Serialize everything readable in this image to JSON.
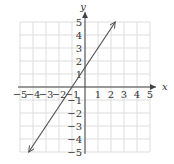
{
  "chart_data": {
    "type": "line",
    "title": "",
    "xlabel": "x",
    "ylabel": "y",
    "xlim": [
      -5,
      5
    ],
    "ylim": [
      -5,
      5
    ],
    "grid": true,
    "x_ticks": [
      "-5",
      "-4",
      "-3",
      "-2",
      "-1",
      "1",
      "2",
      "3",
      "4",
      "5"
    ],
    "y_ticks": [
      "5",
      "4",
      "3",
      "2",
      "1",
      "-1",
      "-2",
      "-3",
      "-4",
      "-5"
    ],
    "series": [
      {
        "name": "line",
        "equation": "y = 1.5x + 1.5",
        "points": [
          [
            -4.33,
            -5
          ],
          [
            -1,
            0
          ],
          [
            0,
            1.5
          ],
          [
            2.33,
            5
          ]
        ],
        "arrows": "both"
      }
    ],
    "colors": {
      "line": "#555555",
      "axis": "#444444",
      "grid": "#dddddd"
    }
  }
}
